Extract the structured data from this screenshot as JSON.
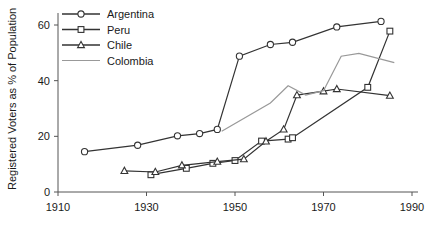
{
  "chart_data": {
    "type": "line",
    "title": "",
    "xlabel": "",
    "ylabel": "Registered Voters as % of Population",
    "xlim": [
      1910,
      1990
    ],
    "ylim": [
      0,
      65
    ],
    "xticks": [
      1910,
      1930,
      1950,
      1970,
      1990
    ],
    "yticks": [
      0,
      20,
      40,
      60
    ],
    "grid": false,
    "legend_position": "top-left",
    "series": [
      {
        "name": "Argentina",
        "marker": "circle",
        "color": "#333333",
        "points": [
          {
            "x": 1916,
            "y": 14.5
          },
          {
            "x": 1928,
            "y": 16.8
          },
          {
            "x": 1937,
            "y": 20.2
          },
          {
            "x": 1942,
            "y": 21.0
          },
          {
            "x": 1946,
            "y": 22.5
          },
          {
            "x": 1951,
            "y": 48.8
          },
          {
            "x": 1958,
            "y": 53.0
          },
          {
            "x": 1963,
            "y": 53.8
          },
          {
            "x": 1973,
            "y": 59.3
          },
          {
            "x": 1983,
            "y": 61.3
          }
        ]
      },
      {
        "name": "Peru",
        "marker": "square",
        "color": "#333333",
        "points": [
          {
            "x": 1931,
            "y": 6.2
          },
          {
            "x": 1939,
            "y": 8.5
          },
          {
            "x": 1945,
            "y": 10.3
          },
          {
            "x": 1950,
            "y": 11.3
          },
          {
            "x": 1956,
            "y": 18.3
          },
          {
            "x": 1962,
            "y": 19.0
          },
          {
            "x": 1963,
            "y": 19.5
          },
          {
            "x": 1980,
            "y": 37.6
          },
          {
            "x": 1985,
            "y": 57.8
          }
        ]
      },
      {
        "name": "Chile",
        "marker": "triangle",
        "color": "#333333",
        "points": [
          {
            "x": 1925,
            "y": 7.6
          },
          {
            "x": 1932,
            "y": 7.2
          },
          {
            "x": 1938,
            "y": 9.6
          },
          {
            "x": 1946,
            "y": 10.9
          },
          {
            "x": 1952,
            "y": 11.8
          },
          {
            "x": 1957,
            "y": 18.2
          },
          {
            "x": 1961,
            "y": 22.5
          },
          {
            "x": 1964,
            "y": 34.8
          },
          {
            "x": 1970,
            "y": 36.2
          },
          {
            "x": 1973,
            "y": 37.0
          },
          {
            "x": 1985,
            "y": 34.6
          }
        ]
      },
      {
        "name": "Colombia",
        "marker": "none",
        "color": "#999999",
        "points": [
          {
            "x": 1947,
            "y": 21.8
          },
          {
            "x": 1958,
            "y": 32.0
          },
          {
            "x": 1962,
            "y": 38.2
          },
          {
            "x": 1966,
            "y": 34.8
          },
          {
            "x": 1970,
            "y": 36.4
          },
          {
            "x": 1974,
            "y": 48.8
          },
          {
            "x": 1978,
            "y": 49.8
          },
          {
            "x": 1986,
            "y": 46.5
          }
        ]
      }
    ]
  },
  "legend": {
    "items": [
      {
        "label": "Argentina",
        "marker": "circle",
        "color": "#333333"
      },
      {
        "label": "Peru",
        "marker": "square",
        "color": "#333333"
      },
      {
        "label": "Chile",
        "marker": "triangle",
        "color": "#333333"
      },
      {
        "label": "Colombia",
        "marker": "none",
        "color": "#999999"
      }
    ]
  },
  "axes": {
    "y_title": "Registered Voters as % of Population",
    "x_tick_labels": [
      "1910",
      "1930",
      "1950",
      "1970",
      "1990"
    ],
    "y_tick_labels": [
      "0",
      "20",
      "40",
      "60"
    ]
  }
}
